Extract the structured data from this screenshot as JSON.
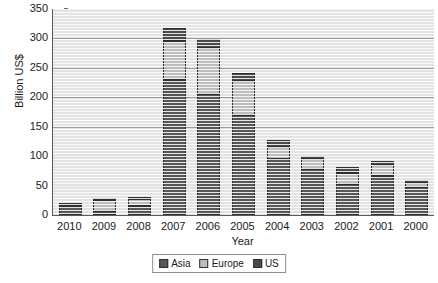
{
  "chart_data": {
    "type": "bar",
    "stacked": true,
    "title": "",
    "xlabel": "Year",
    "ylabel": "Billion US$",
    "categories": [
      "2010",
      "2009",
      "2008",
      "2007",
      "2006",
      "2005",
      "2004",
      "2003",
      "2002",
      "2001",
      "2000"
    ],
    "series": [
      {
        "name": "Asia",
        "color": "#575757",
        "values": [
          13,
          7,
          16,
          230,
          205,
          170,
          95,
          78,
          52,
          67,
          47
        ]
      },
      {
        "name": "Europe",
        "color": "#bdbdbd",
        "values": [
          4,
          18,
          11,
          65,
          78,
          58,
          20,
          17,
          20,
          18,
          8
        ]
      },
      {
        "name": "US",
        "color": "#4a4a4a",
        "values": [
          2,
          2,
          3,
          22,
          16,
          13,
          12,
          5,
          10,
          6,
          4
        ]
      }
    ],
    "totals": [
      19,
      27,
      30,
      317,
      299,
      241,
      127,
      100,
      82,
      91,
      59
    ],
    "ylim": [
      0,
      350
    ],
    "yticks": [
      0,
      50,
      100,
      150,
      200,
      250,
      300,
      350
    ],
    "grid": true,
    "legend_position": "bottom",
    "legend": [
      "Asia",
      "Europe",
      "US"
    ]
  }
}
